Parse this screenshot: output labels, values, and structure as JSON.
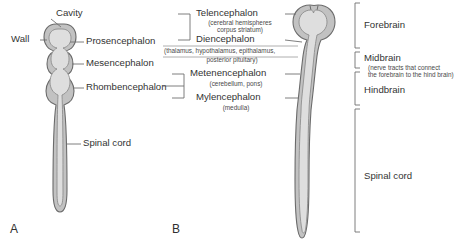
{
  "figure": {
    "panels": [
      {
        "letter": "A",
        "name": "early-neural-tube",
        "labels": [
          {
            "id": "cavity",
            "text": "Cavity"
          },
          {
            "id": "wall",
            "text": "Wall"
          },
          {
            "id": "prosencephalon",
            "text": "Prosencephalon"
          },
          {
            "id": "mesencephalon",
            "text": "Mesencephalon"
          },
          {
            "id": "rhombencephalon",
            "text": "Rhombencephalon"
          },
          {
            "id": "spinal-cord",
            "text": "Spinal cord"
          }
        ]
      },
      {
        "letter": "B",
        "name": "developed-brain-vesicles",
        "left_labels": [
          {
            "id": "telencephalon",
            "text": "Telencephalon",
            "sub": "(cerebral hemispheres\ncorpus striatum)"
          },
          {
            "id": "diencephalon",
            "text": "Diencephalon",
            "sub": "(thalamus, hypothalamus, epithalamus,\nposterior pituitary)"
          },
          {
            "id": "metenencephalon",
            "text": "Metenencephalon",
            "sub": "(cerebellum, pons)"
          },
          {
            "id": "mylencephalon",
            "text": "Mylencephalon",
            "sub": "(medulla)"
          }
        ],
        "right_labels": [
          {
            "id": "forebrain",
            "text": "Forebrain",
            "sub": ""
          },
          {
            "id": "midbrain",
            "text": "Midbrain",
            "sub": "(nerve tracts that connect\nthe forebrain to the hind brain)"
          },
          {
            "id": "hindbrain",
            "text": "Hindbrain",
            "sub": ""
          },
          {
            "id": "spinal-cord-b",
            "text": "Spinal cord",
            "sub": ""
          }
        ]
      }
    ]
  },
  "colors": {
    "outline": "#6e6e6e",
    "wall_fill": "#c9c9c9",
    "cavity_fill": "#dcdcdc",
    "leader_line": "#707070",
    "text": "#333333",
    "background": "#ffffff"
  },
  "text": {
    "a_cavity": "Cavity",
    "a_wall": "Wall",
    "a_prosencephalon": "Prosencephalon",
    "a_mesencephalon": "Mesencephalon",
    "a_rhombencephalon": "Rhombencephalon",
    "a_spinal_cord": "Spinal cord",
    "a_letter": "A",
    "b_telencephalon": "Telencephalon",
    "b_telencephalon_sub1": "(cerebral hemispheres",
    "b_telencephalon_sub2": "corpus striatum)",
    "b_diencephalon": "Diencephalon",
    "b_diencephalon_sub1": "(thalamus, hypothalamus, epithalamus,",
    "b_diencephalon_sub2": "posterior pituitary)",
    "b_metenencephalon": "Metenencephalon",
    "b_metenencephalon_sub": "(cerebellum, pons)",
    "b_mylencephalon": "Mylencephalon",
    "b_mylencephalon_sub": "(medulla)",
    "b_forebrain": "Forebrain",
    "b_midbrain": "Midbrain",
    "b_midbrain_sub1": "(nerve tracts that connect",
    "b_midbrain_sub2": "the forebrain to the hind brain)",
    "b_hindbrain": "Hindbrain",
    "b_spinal_cord": "Spinal cord",
    "b_letter": "B"
  }
}
